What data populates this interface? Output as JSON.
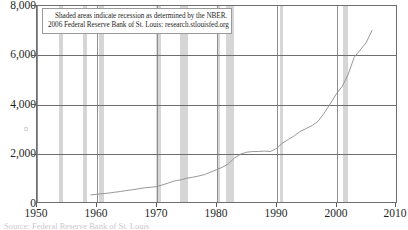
{
  "chart_data": {
    "type": "line",
    "title": "",
    "subtitle": "",
    "xlabel": "",
    "ylabel": "",
    "xlim": [
      1950,
      2010
    ],
    "ylim": [
      0,
      8000
    ],
    "grid": true,
    "legend_position": "none",
    "y_ticks": [
      "0",
      "2,000",
      "4,000",
      "6,000",
      "8,000"
    ],
    "y_tick_values": [
      0,
      2000,
      4000,
      6000,
      8000
    ],
    "x_ticks": [
      "1950",
      "1960",
      "1970",
      "1980",
      "1990",
      "2000",
      "2010"
    ],
    "x_tick_values": [
      1950,
      1960,
      1970,
      1980,
      1990,
      2000,
      2010
    ],
    "series": [
      {
        "name": "series-1",
        "color": "#8c8c8c",
        "x": [
          1959.0,
          1960.0,
          1961.0,
          1962.0,
          1963.0,
          1964.0,
          1965.0,
          1966.0,
          1967.0,
          1968.0,
          1969.0,
          1970.0,
          1971.0,
          1972.0,
          1973.0,
          1974.0,
          1975.0,
          1976.0,
          1977.0,
          1978.0,
          1979.0,
          1980.0,
          1981.0,
          1982.0,
          1983.0,
          1984.0,
          1985.0,
          1986.0,
          1987.0,
          1988.0,
          1989.0,
          1990.0,
          1991.0,
          1992.0,
          1993.0,
          1994.0,
          1995.0,
          1996.0,
          1997.0,
          1998.0,
          1999.0,
          2000.0,
          2001.0,
          2002.0,
          2003.0,
          2004.0,
          2005.0,
          2005.5,
          2006.0
        ],
        "y": [
          290,
          315,
          340,
          365,
          400,
          430,
          470,
          500,
          540,
          580,
          600,
          630,
          700,
          780,
          860,
          900,
          970,
          1010,
          1060,
          1120,
          1220,
          1320,
          1420,
          1560,
          1800,
          1950,
          2030,
          2060,
          2060,
          2080,
          2060,
          2180,
          2400,
          2550,
          2700,
          2880,
          3000,
          3120,
          3300,
          3630,
          4000,
          4400,
          4720,
          5200,
          5900,
          6200,
          6500,
          6750,
          7000
        ]
      }
    ],
    "recession_bands": [
      {
        "start": 1953.6,
        "end": 1954.4
      },
      {
        "start": 1957.7,
        "end": 1958.4
      },
      {
        "start": 1960.4,
        "end": 1961.2
      },
      {
        "start": 1969.9,
        "end": 1970.8
      },
      {
        "start": 1973.9,
        "end": 1975.2
      },
      {
        "start": 1980.1,
        "end": 1980.6
      },
      {
        "start": 1981.6,
        "end": 1982.9
      },
      {
        "start": 1990.6,
        "end": 1991.2
      },
      {
        "start": 2001.2,
        "end": 2001.9
      }
    ],
    "annotation": {
      "line1": "Shaded areas indicate recession as determined by the NBER.",
      "line2": "2006 Federal Reserve Bank of St. Louis: research.stlouisfed.org"
    },
    "axis_glyph": "¤",
    "caption": "Source:  Federal  Reserve  Bank  of St. Louis",
    "colors": {
      "line": "#8c8c8c",
      "recession_band": "#d6d6d6",
      "gridline": "#6e6e6e",
      "frame": "#6e6e6e",
      "text": "#1f1f1f",
      "background": "#ffffff"
    }
  }
}
